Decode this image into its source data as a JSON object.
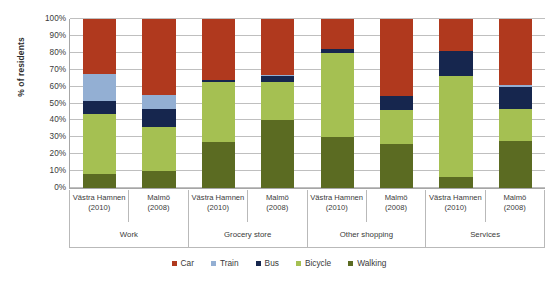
{
  "chart_data": {
    "type": "bar",
    "subtype": "stacked-bar-100",
    "title": "",
    "xlabel": "",
    "ylabel": "% of residents",
    "ylim": [
      0,
      100
    ],
    "ytick_labels": [
      "0%",
      "10%",
      "20%",
      "30%",
      "40%",
      "50%",
      "60%",
      "70%",
      "80%",
      "90%",
      "100%"
    ],
    "ytick_values": [
      0,
      10,
      20,
      30,
      40,
      50,
      60,
      70,
      80,
      90,
      100
    ],
    "grid": true,
    "legend_position": "bottom",
    "stack_order_bottom_to_top": [
      "Walking",
      "Bicycle",
      "Bus",
      "Train",
      "Car"
    ],
    "groups": [
      "Work",
      "Grocery store",
      "Other shopping",
      "Services"
    ],
    "categories": [
      "Västra Hamnen (2010)",
      "Malmö (2008)",
      "Västra Hamnen (2010)",
      "Malmö (2008)",
      "Västra Hamnen (2010)",
      "Malmö (2008)",
      "Västra Hamnen (2010)",
      "Malmö (2008)"
    ],
    "series": [
      {
        "name": "Car",
        "color": "#b0391e",
        "values": [
          32.5,
          45.0,
          36.0,
          33.0,
          18.0,
          45.5,
          19.0,
          39.0
        ]
      },
      {
        "name": "Train",
        "color": "#93afd3",
        "values": [
          16.0,
          8.5,
          0.0,
          1.0,
          0.0,
          0.0,
          0.0,
          1.0
        ]
      },
      {
        "name": "Bus",
        "color": "#16264e",
        "values": [
          7.5,
          10.5,
          1.0,
          3.5,
          2.0,
          8.5,
          14.5,
          13.5
        ]
      },
      {
        "name": "Bicycle",
        "color": "#a5c052",
        "values": [
          35.5,
          26.0,
          36.0,
          22.5,
          50.0,
          20.0,
          60.0,
          18.5
        ]
      },
      {
        "name": "Walking",
        "color": "#5b6b22",
        "values": [
          8.5,
          10.0,
          27.0,
          40.0,
          30.0,
          26.0,
          6.5,
          28.0
        ]
      }
    ]
  },
  "xaxis": {
    "tick_lines": [
      {
        "name": "Västra Hamnen",
        "year": "(2010)"
      },
      {
        "name": "Malmö",
        "year": "(2008)"
      },
      {
        "name": "Västra Hamnen",
        "year": "(2010)"
      },
      {
        "name": "Malmö",
        "year": "(2008)"
      },
      {
        "name": "Västra Hamnen",
        "year": "(2010)"
      },
      {
        "name": "Malmö",
        "year": "(2008)"
      },
      {
        "name": "Västra Hamnen",
        "year": "(2010)"
      },
      {
        "name": "Malmö",
        "year": "(2008)"
      }
    ],
    "groups": [
      {
        "label": "Work"
      },
      {
        "label": "Grocery store"
      },
      {
        "label": "Other shopping"
      },
      {
        "label": "Services"
      }
    ]
  },
  "legend": {
    "items": [
      {
        "label": "Car",
        "color": "#b0391e"
      },
      {
        "label": "Train",
        "color": "#93afd3"
      },
      {
        "label": "Bus",
        "color": "#16264e"
      },
      {
        "label": "Bicycle",
        "color": "#a5c052"
      },
      {
        "label": "Walking",
        "color": "#5b6b22"
      }
    ]
  },
  "colors": {
    "car": "#b0391e",
    "train": "#93afd3",
    "bus": "#16264e",
    "bicycle": "#a5c052",
    "walking": "#5b6b22",
    "gridline": "#bfbfbf",
    "axis": "#a6a6a6",
    "text": "#3a3a3a",
    "background": "#ffffff"
  }
}
